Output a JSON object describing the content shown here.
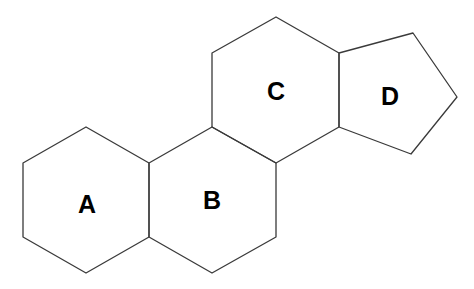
{
  "diagram": {
    "line_color": "#3a3a3a",
    "rings": [
      {
        "id": "A",
        "label": "A",
        "type": "hexagon",
        "points": "86,127 149,163 149,237 86,273 23,237 23,163",
        "label_pos": [
          87,
          213
        ]
      },
      {
        "id": "B",
        "label": "B",
        "type": "hexagon",
        "points": "149,163 212,127 276,163 276,237 212,273 149,237",
        "label_pos": [
          212,
          209
        ]
      },
      {
        "id": "C",
        "label": "C",
        "type": "hexagon",
        "points": "212,127 212,53 276,17 339,53 339,127 276,163",
        "label_pos": [
          276,
          100
        ]
      },
      {
        "id": "D",
        "label": "D",
        "type": "pentagon",
        "points": "339,53 413,33 457,97 411,154 339,127",
        "label_pos": [
          390,
          105
        ]
      }
    ]
  }
}
